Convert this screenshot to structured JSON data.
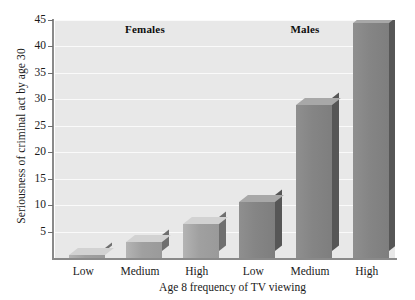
{
  "chart_data": {
    "type": "bar",
    "title": "",
    "xlabel": "Age 8 frequency of TV viewing",
    "ylabel": "Seriousness of criminal act by age 30",
    "ylim": [
      0,
      45
    ],
    "yticks": [
      5,
      10,
      15,
      20,
      25,
      30,
      35,
      40,
      45
    ],
    "ytick_labels": [
      "5",
      "10",
      "15",
      "20",
      "25",
      "30",
      "35",
      "40",
      "45"
    ],
    "grid": "horizontal",
    "legend": "none",
    "categories": [
      "Low",
      "Medium",
      "High",
      "Low",
      "Medium",
      "High"
    ],
    "values": [
      0.5,
      3,
      6.5,
      10.5,
      29,
      44.5
    ],
    "groups": [
      {
        "label": "Females",
        "categories": [
          "Low",
          "Medium",
          "High"
        ],
        "values": [
          0.5,
          3,
          6.5
        ]
      },
      {
        "label": "Males",
        "categories": [
          "Low",
          "Medium",
          "High"
        ],
        "values": [
          10.5,
          29,
          44.5
        ]
      }
    ],
    "colors": {
      "females_bar": "#a0a0a0",
      "males_bar": "#858585",
      "plot_background": "#e8e8e8",
      "gridline": "#fafafa",
      "axis": "#8a8a8a",
      "text": "#1a1a1a"
    }
  },
  "axes": {
    "y_title": "Seriousness of criminal act by age 30",
    "x_title": "Age 8 frequency of TV viewing"
  },
  "group_headers": {
    "females": "Females",
    "males": "Males"
  }
}
